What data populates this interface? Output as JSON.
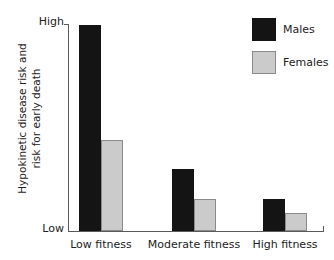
{
  "chart_data": {
    "type": "bar",
    "title": "",
    "xlabel": "",
    "ylabel_line1": "Hypokinetic disease risk and",
    "ylabel_line2": "risk for early death",
    "categories": [
      "Low fitness",
      "Moderate fitness",
      "High fitness"
    ],
    "series": [
      {
        "name": "Males",
        "color": "#141414",
        "values": [
          1.0,
          0.3,
          0.155
        ]
      },
      {
        "name": "Females",
        "color": "#cbcbcb",
        "values": [
          0.44,
          0.155,
          0.087
        ]
      }
    ],
    "ylim": [
      0,
      1
    ],
    "ytick_labels": [
      "Low",
      "High"
    ],
    "ytick_low": "Low",
    "ytick_high": "High",
    "grid": false,
    "legend_position": "top-right",
    "annotations": []
  },
  "legend": {
    "items": [
      {
        "label": "Males",
        "swatch": "black-square-swatch"
      },
      {
        "label": "Females",
        "swatch": "gray-square-swatch"
      }
    ]
  }
}
